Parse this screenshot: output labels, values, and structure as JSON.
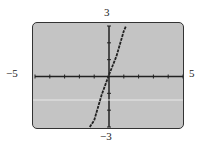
{
  "chart_data": {
    "type": "line",
    "title": "",
    "xlabel": "",
    "ylabel": "",
    "xlim": [
      -5,
      5
    ],
    "ylim": [
      -3,
      3
    ],
    "xscale": 1,
    "yscale": 1,
    "grid": false,
    "labels": {
      "xmin": "−5",
      "xmax": "5",
      "ymin": "−3",
      "ymax": "3"
    },
    "series": [
      {
        "name": "f(x)",
        "x": [
          -1.3,
          -1.0,
          -0.5,
          0,
          0.5,
          1.0,
          1.15
        ],
        "y": [
          -3.0,
          -2.6,
          -1.1,
          0.1,
          1.2,
          2.7,
          3.0
        ]
      }
    ],
    "colors": {
      "screen": "#c4c4c4",
      "curve": "#222222",
      "axes": "#222222"
    }
  }
}
